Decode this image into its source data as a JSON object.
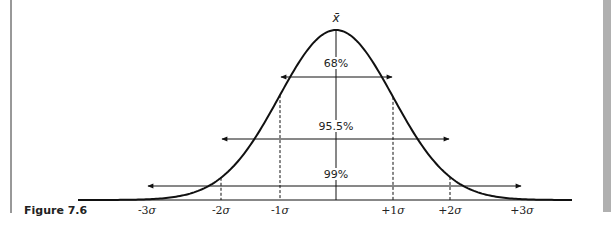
{
  "figure": {
    "caption": "Figure 7.6",
    "mean_symbol": "x̄"
  },
  "chart_data": {
    "type": "line",
    "caption": "Figure 7.6",
    "mean_label": "x̄",
    "x_ticks": [
      "-3σ",
      "-2σ",
      "-1σ",
      "+1σ",
      "+2σ",
      "+3σ"
    ],
    "intervals": [
      {
        "label": "68%",
        "from": "-1σ",
        "to": "+1σ"
      },
      {
        "label": "95.5%",
        "from": "-2σ",
        "to": "+2σ"
      },
      {
        "label": "99%",
        "from": "-3σ",
        "to": "+3σ"
      }
    ],
    "grid": false,
    "legend": "none"
  },
  "ticks": [
    {
      "prefix": "-3",
      "sym": "σ"
    },
    {
      "prefix": "-2",
      "sym": "σ"
    },
    {
      "prefix": "-1",
      "sym": "σ"
    },
    {
      "prefix": "+1",
      "sym": "σ"
    },
    {
      "prefix": "+2",
      "sym": "σ"
    },
    {
      "prefix": "+3",
      "sym": "σ"
    }
  ],
  "intervals": [
    {
      "label": "68%"
    },
    {
      "label": "95.5%"
    },
    {
      "label": "99%"
    }
  ],
  "colors": {
    "line": "#111111",
    "side_bar": "#b0b0b0"
  }
}
